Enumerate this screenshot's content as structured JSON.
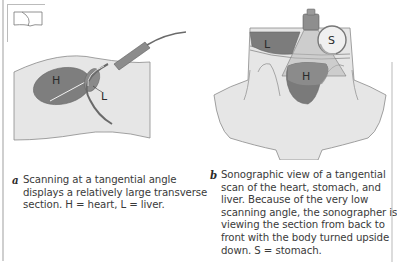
{
  "figure": {
    "panel_a": {
      "labels": {
        "heart": "H",
        "liver": "L"
      },
      "orientation_icon": "transducer-orientation-icon",
      "caption": {
        "letter": "a",
        "lines": [
          "Scanning at a tangential angle",
          "displays a relatively large transverse",
          "section. H = heart, L = liver."
        ]
      }
    },
    "panel_b": {
      "labels": {
        "liver": "L",
        "stomach": "S",
        "heart": "H"
      },
      "caption": {
        "letter": "b",
        "lines": [
          "Sonographic view of a tangential",
          "scan of the heart, stomach, and",
          "liver. Because of the very low",
          "scanning angle, the sonographer is",
          "viewing the section from back to",
          "front with the body turned upside",
          "down. S = stomach."
        ]
      }
    },
    "colors": {
      "body_fill": "#e6e6e6",
      "organ_dark": "#7d7d7d",
      "organ_mid": "#9a9a9a",
      "outline": "#6e6e6e",
      "probe": "#8c8c8c",
      "text": "#3a3a3a"
    }
  }
}
